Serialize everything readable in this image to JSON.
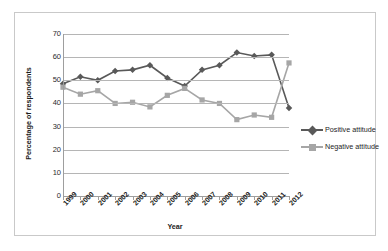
{
  "chart_data": {
    "type": "line",
    "title": "",
    "xlabel": "Year",
    "ylabel": "Percentage of respondents",
    "categories": [
      "1999",
      "2000",
      "2001",
      "2002",
      "2003",
      "2004",
      "2005",
      "2006",
      "2007",
      "2008",
      "2009",
      "2010",
      "2011",
      "2012"
    ],
    "ylim": [
      0,
      70
    ],
    "ytick_labels": [
      "70",
      "60",
      "50",
      "40",
      "30",
      "20",
      "10",
      "0"
    ],
    "ytick_values": [
      70,
      60,
      50,
      40,
      30,
      20,
      10,
      0
    ],
    "grid": "horizontal",
    "legend_position": "right",
    "series": [
      {
        "name": "Positive attitude",
        "color": "#595959",
        "marker": "diamond",
        "values": [
          48.5,
          51.5,
          50.0,
          54.0,
          54.5,
          56.5,
          51.0,
          47.5,
          54.5,
          56.5,
          62.0,
          60.5,
          61.0,
          38.0
        ]
      },
      {
        "name": "Negative attitude",
        "color": "#a6a6a6",
        "marker": "square",
        "values": [
          47.0,
          44.0,
          45.5,
          40.0,
          40.5,
          38.5,
          43.5,
          46.5,
          41.5,
          40.0,
          33.0,
          35.0,
          34.0,
          57.5
        ]
      }
    ]
  }
}
